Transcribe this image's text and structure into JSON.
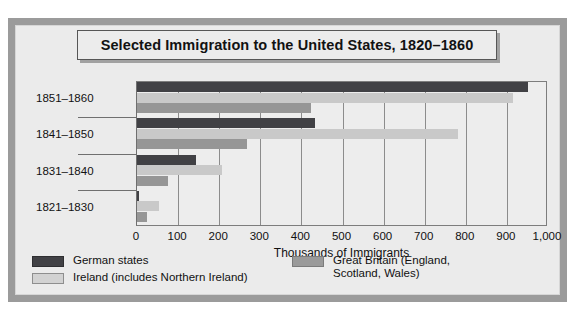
{
  "chart_data": {
    "type": "bar",
    "orientation": "horizontal",
    "title": "Selected Immigration to the United States, 1820–1860",
    "xlabel": "Thousands of Immigrants",
    "ylabel": "",
    "xlim": [
      0,
      1000
    ],
    "xticks": [
      "0",
      "100",
      "200",
      "300",
      "400",
      "500",
      "600",
      "700",
      "800",
      "900",
      "1,000"
    ],
    "xtick_values": [
      0,
      100,
      200,
      300,
      400,
      500,
      600,
      700,
      800,
      900,
      1000
    ],
    "grid": true,
    "legend_position": "bottom",
    "categories": [
      "1851–1860",
      "1841–1850",
      "1831–1840",
      "1821–1830"
    ],
    "series": [
      {
        "name": "German states",
        "color": "#414145",
        "values": [
          951,
          434,
          143,
          6
        ]
      },
      {
        "name": "Ireland (includes Northern Ireland)",
        "color": "#c9c9c9",
        "values": [
          914,
          781,
          207,
          54
        ]
      },
      {
        "name": "Great Britain (England, Scotland, Wales)",
        "color": "#969696",
        "values": [
          424,
          267,
          76,
          25
        ]
      }
    ]
  },
  "legend": {
    "items": [
      {
        "label": "German states",
        "swatch": "german"
      },
      {
        "label": "Ireland (includes Northern Ireland)",
        "swatch": "ireland"
      },
      {
        "label": "Great Britain (England,\nScotland, Wales)",
        "swatch": "britain"
      }
    ]
  },
  "colors": {
    "german": "#414145",
    "ireland": "#c9c9c9",
    "britain": "#969696",
    "frame": "#9b9b9b",
    "panel": "#ebebeb"
  }
}
